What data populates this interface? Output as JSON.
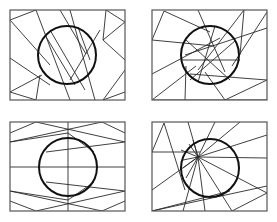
{
  "figure": {
    "colors": {
      "background": "#ffffff",
      "frame": "#555555",
      "lines": "#2a2a2a",
      "circle": "#111111"
    },
    "panels": [
      {
        "id": "top-left",
        "frame": {
          "x": 10,
          "y": 10,
          "w": 115,
          "h": 90
        },
        "circle": {
          "cx": 67,
          "cy": 55,
          "r": 29
        },
        "lines": [
          [
            10,
            20,
            36,
            10
          ],
          [
            36,
            10,
            70,
            100
          ],
          [
            10,
            20,
            50,
            65
          ],
          [
            70,
            10,
            95,
            100
          ],
          [
            10,
            58,
            50,
            85
          ],
          [
            42,
            75,
            10,
            92
          ],
          [
            10,
            92,
            36,
            100
          ],
          [
            36,
            100,
            40,
            75
          ],
          [
            106,
            10,
            103,
            40
          ],
          [
            106,
            10,
            125,
            22
          ],
          [
            125,
            22,
            103,
            40
          ],
          [
            103,
            40,
            125,
            60
          ],
          [
            125,
            70,
            103,
            100
          ],
          [
            103,
            100,
            125,
            92
          ],
          [
            60,
            10,
            86,
            54
          ],
          [
            50,
            30,
            85,
            90
          ],
          [
            45,
            35,
            75,
            85
          ],
          [
            78,
            27,
            90,
            60
          ],
          [
            100,
            30,
            70,
            80
          ]
        ]
      },
      {
        "id": "top-right",
        "frame": {
          "x": 152,
          "y": 10,
          "w": 115,
          "h": 90
        },
        "circle": {
          "cx": 210,
          "cy": 55,
          "r": 29
        },
        "lines": [
          [
            152,
            40,
            164,
            11
          ],
          [
            164,
            11,
            210,
            32
          ],
          [
            152,
            40,
            214,
            46
          ],
          [
            152,
            74,
            220,
            38
          ],
          [
            198,
            10,
            225,
            72
          ],
          [
            244,
            10,
            240,
            55
          ],
          [
            244,
            10,
            198,
            70
          ],
          [
            267,
            12,
            232,
            66
          ],
          [
            267,
            28,
            185,
            55
          ],
          [
            267,
            80,
            190,
            74
          ],
          [
            267,
            80,
            225,
            100
          ],
          [
            225,
            100,
            205,
            72
          ],
          [
            152,
            100,
            196,
            66
          ],
          [
            185,
            100,
            186,
            66
          ],
          [
            186,
            40,
            230,
            80
          ],
          [
            182,
            60,
            240,
            60
          ],
          [
            198,
            82,
            215,
            26
          ],
          [
            236,
            40,
            190,
            80
          ],
          [
            152,
            100,
            267,
            100
          ]
        ]
      },
      {
        "id": "bottom-left",
        "frame": {
          "x": 10,
          "y": 122,
          "w": 115,
          "h": 89
        },
        "circle": {
          "cx": 68,
          "cy": 167,
          "r": 29
        },
        "lines": [
          [
            10,
            133,
            36,
            122
          ],
          [
            36,
            122,
            125,
            142
          ],
          [
            10,
            142,
            102,
            122
          ],
          [
            102,
            122,
            125,
            133
          ],
          [
            46,
            152,
            125,
            142
          ],
          [
            10,
            142,
            68,
            133
          ],
          [
            68,
            133,
            94,
            152
          ],
          [
            68,
            122,
            68,
            211
          ],
          [
            10,
            167,
            125,
            167
          ],
          [
            10,
            201,
            36,
            211
          ],
          [
            36,
            211,
            125,
            191
          ],
          [
            10,
            191,
            102,
            211
          ],
          [
            102,
            211,
            125,
            201
          ],
          [
            46,
            182,
            125,
            191
          ],
          [
            10,
            191,
            68,
            200
          ],
          [
            68,
            200,
            94,
            182
          ]
        ]
      },
      {
        "id": "bottom-right",
        "frame": {
          "x": 152,
          "y": 122,
          "w": 115,
          "h": 89
        },
        "circle": {
          "cx": 210,
          "cy": 168,
          "r": 29
        },
        "lines": [
          [
            152,
            152,
            164,
            123
          ],
          [
            164,
            123,
            185,
            190
          ],
          [
            152,
            152,
            200,
            152
          ],
          [
            198,
            157,
            240,
            122
          ],
          [
            198,
            157,
            267,
            135
          ],
          [
            198,
            157,
            267,
            158
          ],
          [
            198,
            157,
            267,
            193
          ],
          [
            198,
            157,
            232,
            211
          ],
          [
            198,
            157,
            205,
            211
          ],
          [
            198,
            157,
            183,
            211
          ],
          [
            198,
            157,
            152,
            190
          ],
          [
            198,
            157,
            188,
            122
          ],
          [
            198,
            157,
            215,
            122
          ],
          [
            198,
            157,
            183,
            168
          ],
          [
            198,
            157,
            186,
            178
          ],
          [
            198,
            157,
            189,
            144
          ],
          [
            198,
            157,
            193,
            140
          ],
          [
            152,
            211,
            267,
            186
          ],
          [
            152,
            211,
            230,
            191
          ],
          [
            267,
            193,
            232,
            211
          ],
          [
            181,
            150,
            198,
            157
          ],
          [
            183,
            160,
            198,
            157
          ]
        ]
      }
    ]
  }
}
